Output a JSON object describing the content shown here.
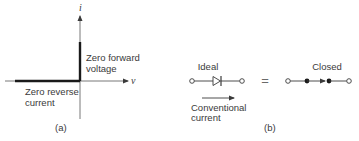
{
  "panel_a": {
    "caption": "(a)",
    "y_axis_label": "i",
    "x_axis_label": "v",
    "forward_label_line1": "Zero forward",
    "forward_label_line2": "voltage",
    "reverse_label_line1": "Zero reverse",
    "reverse_label_line2": "current"
  },
  "panel_b": {
    "caption": "(b)",
    "ideal_label": "Ideal",
    "equals_sign": "=",
    "closed_label": "Closed",
    "current_label_line1": "Conventional",
    "current_label_line2": "current",
    "icons": {
      "diode": "diode-symbol-icon",
      "closed_switch": "closed-switch-icon",
      "current_arrow": "arrow-right-icon"
    }
  },
  "colors": {
    "line": "#3a3a3a",
    "bold_line": "#1a1a1a",
    "background": "#ffffff"
  }
}
